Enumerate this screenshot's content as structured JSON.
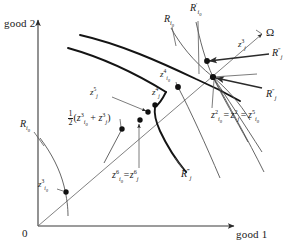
{
  "figure": {
    "type": "economics-indifference-curve-diagram",
    "axes": {
      "x_label": "good 1",
      "y_label": "good 2",
      "origin_label": "0"
    },
    "ray_label": "Ω",
    "curve_labels": {
      "r_i0_top": "R",
      "r_i0_top_sub": "i",
      "r_i0_top_sub2": "0",
      "r_prime_i0": "R",
      "r_i0_left": "R",
      "r_dprime_j_upper": "R",
      "r_dprime_j_lower": "R",
      "r_tprime_j": "R"
    },
    "labels": [
      {
        "name": "r-i0-top",
        "text_html": "R<sub>i<sub>0</sub></sub>",
        "x": 166,
        "y": 18
      },
      {
        "name": "r-prime-i0",
        "text_html": "R<sup>′</sup><sub>i<sub>0</sub></sub>",
        "x": 193,
        "y": 6
      },
      {
        "name": "omega",
        "text_html": "Ω",
        "x": 266,
        "y": 29
      },
      {
        "name": "z-j-3-top",
        "text_html": "z<sup>3</sup><sub>j</sub>",
        "x": 240,
        "y": 44
      },
      {
        "name": "r-dprime-j-up",
        "text_html": "R<sup>″</sup><sub>j</sub>",
        "x": 272,
        "y": 52
      },
      {
        "name": "z-i0-4",
        "text_html": "z<sup>4</sup><sub>i<sub>0</sub></sub>",
        "x": 163,
        "y": 76
      },
      {
        "name": "r-dprime-j-low",
        "text_html": "R<sup>″</sup><sub>j</sub>",
        "x": 267,
        "y": 94
      },
      {
        "name": "z-j-5",
        "text_html": "z<sup>5</sup><sub>j</sub>",
        "x": 93,
        "y": 93
      },
      {
        "name": "z-j-4",
        "text_html": "z<sup>4</sup><sub>j</sub>",
        "x": 155,
        "y": 93
      },
      {
        "name": "half-sum",
        "text_html": "FRACTION(z<sup>3</sup><sub>i<sub>0</sub></sub> + z<sup>3</sup><sub>j</sub>)",
        "x": 72,
        "y": 114
      },
      {
        "name": "equation-z2",
        "text_html": "z<sup>2</sup><sub>i<sub>0</sub></sub> = z<sup>2</sup><sub>j</sub> = z<sup>5</sup><sub>i<sub>0</sub></sub>",
        "x": 213,
        "y": 113
      },
      {
        "name": "r-i0-left",
        "text_html": "R<sub>i<sub>0</sub></sub>",
        "x": 22,
        "y": 124
      },
      {
        "name": "z-i0-6-eq-z-j-6",
        "text_html": "z<sup>6</sup><sub>i<sub>0</sub></sub> = z<sup>6</sup><sub>j</sub>",
        "x": 116,
        "y": 175
      },
      {
        "name": "r-tprime-j",
        "text_html": "R<sup>‴</sup><sub>j</sub>",
        "x": 183,
        "y": 173
      },
      {
        "name": "z-i0-3",
        "text_html": "z<sup>3</sup><sub>i<sub>0</sub></sub>",
        "x": 40,
        "y": 183
      }
    ],
    "equation_parts": {
      "term1_base": "z",
      "term1_sup": "2",
      "term1_sub": "i",
      "term1_sub2": "0",
      "term2_base": "z",
      "term2_sup": "2",
      "term2_sub": "j",
      "term3_base": "z",
      "term3_sup": "5",
      "term3_sub": "i",
      "term3_sub2": "0",
      "eq": "="
    },
    "fraction": {
      "numerator": "1",
      "denominator": "2"
    },
    "points": [
      {
        "name": "z-i0-3-point",
        "x": 66,
        "y": 192
      },
      {
        "name": "half-sum-point",
        "x": 122,
        "y": 129
      },
      {
        "name": "z-i0-6-point",
        "x": 140,
        "y": 120
      },
      {
        "name": "z-j-5-point",
        "x": 148,
        "y": 112
      },
      {
        "name": "z-j-4-point",
        "x": 155,
        "y": 105
      },
      {
        "name": "z-i0-4-point",
        "x": 178,
        "y": 87
      },
      {
        "name": "z-j-3-point",
        "x": 207,
        "y": 61
      },
      {
        "name": "intersection",
        "x": 213,
        "y": 77
      }
    ],
    "colors": {
      "ink": "#1a1a1a",
      "thin": "#555555",
      "background": "#ffffff"
    }
  }
}
